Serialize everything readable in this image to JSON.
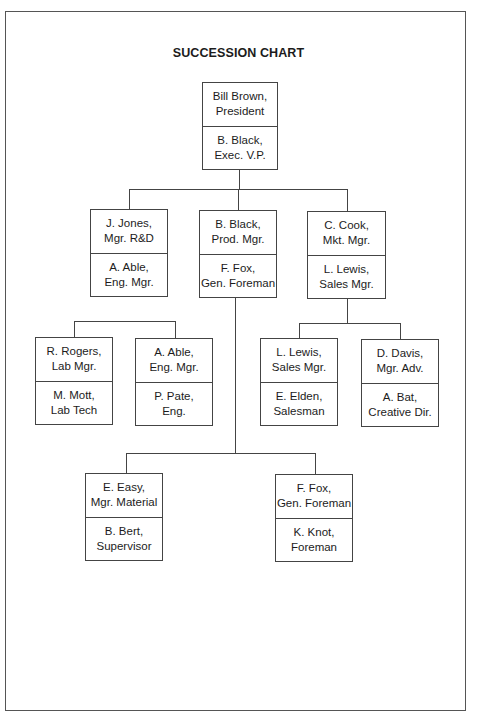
{
  "title": "SUCCESSION CHART",
  "nodes": {
    "president": {
      "top": [
        "Bill Brown,",
        "President"
      ],
      "successor": [
        "B. Black,",
        "Exec. V.P."
      ]
    },
    "rnd": {
      "top": [
        "J. Jones,",
        "Mgr. R&D"
      ],
      "successor": [
        "A. Able,",
        "Eng. Mgr."
      ]
    },
    "production": {
      "top": [
        "B. Black,",
        "Prod. Mgr."
      ],
      "successor": [
        "F. Fox,",
        "Gen. Foreman"
      ]
    },
    "marketing": {
      "top": [
        "C. Cook,",
        "Mkt. Mgr."
      ],
      "successor": [
        "L. Lewis,",
        "Sales Mgr."
      ]
    },
    "lab": {
      "top": [
        "R. Rogers,",
        "Lab Mgr."
      ],
      "successor": [
        "M. Mott,",
        "Lab Tech"
      ]
    },
    "engineering": {
      "top": [
        "A. Able,",
        "Eng. Mgr."
      ],
      "successor": [
        "P. Pate,",
        "Eng."
      ]
    },
    "sales": {
      "top": [
        "L. Lewis,",
        "Sales Mgr."
      ],
      "successor": [
        "E. Elden,",
        "Salesman"
      ]
    },
    "advertising": {
      "top": [
        "D. Davis,",
        "Mgr. Adv."
      ],
      "successor": [
        "A. Bat,",
        "Creative Dir."
      ]
    },
    "material": {
      "top": [
        "E. Easy,",
        "Mgr. Material"
      ],
      "successor": [
        "B. Bert,",
        "Supervisor"
      ]
    },
    "foreman": {
      "top": [
        "F. Fox,",
        "Gen. Foreman"
      ],
      "successor": [
        "K. Knot,",
        "Foreman"
      ]
    }
  }
}
